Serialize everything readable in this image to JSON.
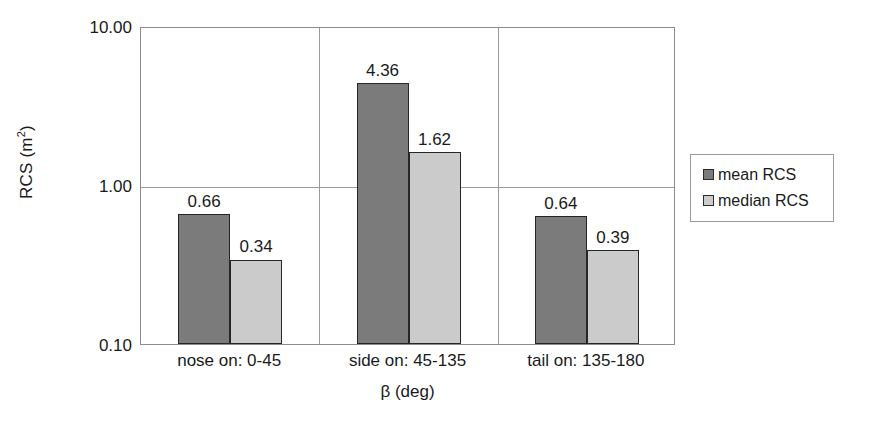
{
  "chart_data": {
    "type": "bar",
    "title": "",
    "xlabel": "β (deg)",
    "ylabel": "RCS (m²)",
    "ylabel_base": "RCS (m",
    "ylabel_sup": "2",
    "ylabel_close": ")",
    "yscale": "log",
    "ylim": [
      0.1,
      10.0
    ],
    "grid": true,
    "legend_position": "right",
    "categories": [
      "nose on:  0-45",
      "side on: 45-135",
      "tail on: 135-180"
    ],
    "ytick_labels": [
      "10.00",
      "1.00",
      "0.10"
    ],
    "ytick_values": [
      10.0,
      1.0,
      0.1
    ],
    "series": [
      {
        "name": "mean RCS",
        "color": "#7b7b7b",
        "values": [
          0.66,
          4.36,
          0.64
        ],
        "value_labels": [
          "0.66",
          "4.36",
          "0.64"
        ]
      },
      {
        "name": "median RCS",
        "color": "#cbcbcb",
        "values": [
          0.34,
          1.62,
          0.39
        ],
        "value_labels": [
          "0.34",
          "1.62",
          "0.39"
        ]
      }
    ]
  },
  "legend": {
    "items": [
      {
        "label": "mean RCS"
      },
      {
        "label": "median RCS"
      }
    ]
  },
  "colors": {
    "mean": "#7b7b7b",
    "median": "#cbcbcb",
    "axis": "#8c8c8c",
    "grid": "#9a9a9a",
    "bar_outline": "#262626",
    "background": "#ffffff"
  }
}
